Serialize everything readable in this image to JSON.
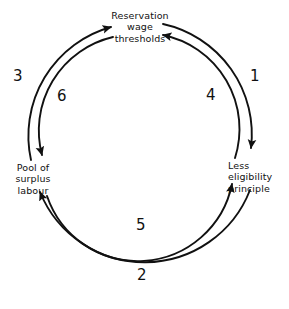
{
  "diagram": {
    "type": "circular-cycle",
    "stroke_color": "#111111",
    "background_color": "#ffffff",
    "nodes": [
      {
        "id": "reservation-wage-thresholds",
        "label": "Reservation\nwage\nthresholds",
        "position": "top"
      },
      {
        "id": "less-eligibility-principle",
        "label": "Less\neligibility\nprinciple",
        "position": "right"
      },
      {
        "id": "pool-of-surplus-labour",
        "label": "Pool of\nsurplus\nlabour",
        "position": "left"
      }
    ],
    "steps": [
      {
        "number": "1",
        "from": "reservation-wage-thresholds",
        "to": "less-eligibility-principle",
        "ring": "outer",
        "direction": "clockwise"
      },
      {
        "number": "2",
        "from": "less-eligibility-principle",
        "to": "pool-of-surplus-labour",
        "ring": "outer",
        "direction": "clockwise"
      },
      {
        "number": "3",
        "from": "pool-of-surplus-labour",
        "to": "reservation-wage-thresholds",
        "ring": "outer",
        "direction": "clockwise"
      },
      {
        "number": "4",
        "from": "less-eligibility-principle",
        "to": "reservation-wage-thresholds",
        "ring": "inner",
        "direction": "counter-clockwise"
      },
      {
        "number": "5",
        "from": "pool-of-surplus-labour",
        "to": "less-eligibility-principle",
        "ring": "inner",
        "direction": "counter-clockwise"
      },
      {
        "number": "6",
        "from": "reservation-wage-thresholds",
        "to": "pool-of-surplus-labour",
        "ring": "inner",
        "direction": "counter-clockwise"
      }
    ]
  }
}
